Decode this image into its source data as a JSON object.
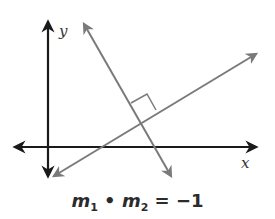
{
  "figure": {
    "axes": {
      "x_label": "x",
      "y_label": "y",
      "color": "#1a1a1a"
    },
    "lines": [
      {
        "name": "line-1",
        "description": "positive slope line",
        "color": "#7a7a7a"
      },
      {
        "name": "line-2",
        "description": "negative slope line",
        "color": "#7a7a7a"
      }
    ],
    "right_angle_marker": true,
    "equation": {
      "var1": "m",
      "sub1": "1",
      "operator": "•",
      "var2": "m",
      "sub2": "2",
      "equals": "=",
      "result": "−1"
    }
  }
}
